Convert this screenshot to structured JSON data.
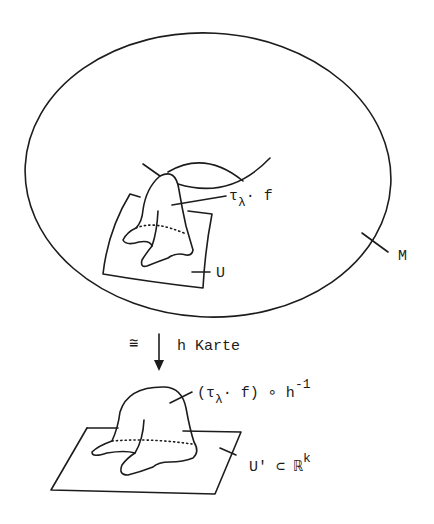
{
  "figure": {
    "manifold_label": "M",
    "chart_domain_label": "U",
    "upper_function": {
      "base": "τ",
      "subscript": "λ",
      "rest": "· f"
    },
    "arrow": {
      "iso_symbol": "≅",
      "map_label": "h Karte"
    },
    "lower_function": {
      "open": "(τ",
      "subscript": "λ",
      "middle": "· f) ∘ h",
      "superscript": "-1"
    },
    "target_domain": {
      "base": "U' ⊂ ℝ",
      "superscript": "k"
    }
  },
  "colors": {
    "ink": "#1c1c1c",
    "background": "#ffffff"
  }
}
